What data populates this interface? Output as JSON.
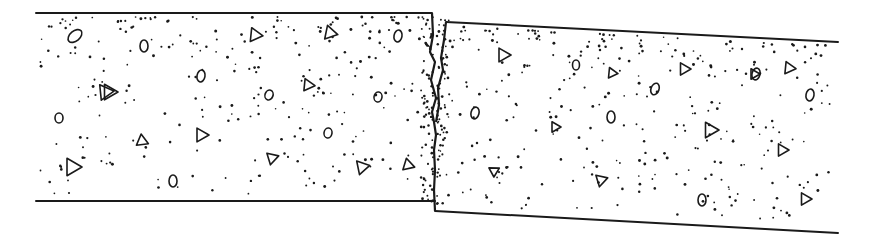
{
  "figure": {
    "title": "Faulted concrete slab joint",
    "ink_color": "#1a1a1a",
    "background_color": "#ffffff",
    "slabs": [
      {
        "name": "left-slab",
        "aggregates": {
          "triangles": 11,
          "ovals": 8
        }
      },
      {
        "name": "right-slab",
        "aggregates": {
          "triangles": 11,
          "ovals": 7
        },
        "relative_position": "displaced downward, sloping down to the right"
      }
    ],
    "joint": {
      "type": "crack",
      "shape": "jagged vertical fracture"
    }
  }
}
